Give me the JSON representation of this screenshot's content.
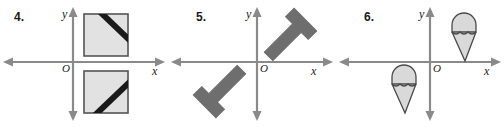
{
  "page": {
    "background": "#ffffff",
    "width": 504,
    "height": 127
  },
  "style": {
    "axis_color": "#8a8a8a",
    "shape_fill_light": "#e2e2e2",
    "shape_fill_gray": "#6e6e6e",
    "shape_fill_cone": "#d9d9d9",
    "shape_outline_dark": "#4a4a4a",
    "shape_outline_black": "#1a1a1a",
    "stripe_color": "#1a1a1a",
    "label_color": "#1a1a1a"
  },
  "panels": [
    {
      "id": "panel-4",
      "number": "4.",
      "y_axis_label": "y",
      "x_axis_label": "x",
      "origin_label": "O",
      "shape_name": "square-with-corner-stripe",
      "shapes": [
        {
          "name": "square-upper-right",
          "quadrant": "I",
          "stripe_corner": "top-right"
        },
        {
          "name": "square-lower-right",
          "quadrant": "IV",
          "stripe_corner": "bottom-right"
        }
      ]
    },
    {
      "id": "panel-5",
      "number": "5.",
      "y_axis_label": "y",
      "x_axis_label": "x",
      "origin_label": "O",
      "shape_name": "tee-shape",
      "shapes": [
        {
          "name": "tee-upper-right",
          "quadrant": "I",
          "rotation_deg": -45
        },
        {
          "name": "tee-lower-left",
          "quadrant": "III",
          "rotation_deg": 135
        }
      ]
    },
    {
      "id": "panel-6",
      "number": "6.",
      "y_axis_label": "y",
      "x_axis_label": "x",
      "origin_label": "O",
      "shape_name": "ice-cream-cone",
      "shapes": [
        {
          "name": "cone-upper-right",
          "quadrant": "I",
          "rotation_deg": 0
        },
        {
          "name": "cone-lower-left",
          "quadrant": "III",
          "rotation_deg": 0
        }
      ]
    }
  ]
}
